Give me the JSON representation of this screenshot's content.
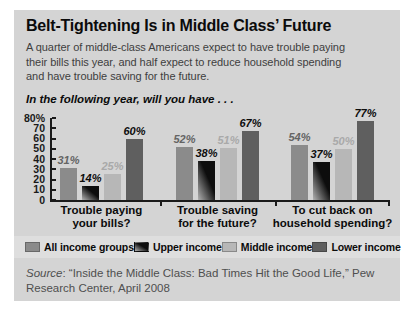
{
  "header": {
    "title": "Belt-Tightening Is in Middle Class’ Future",
    "subtitle": "A quarter of middle-class Americans expect to have trouble paying\ntheir bills this year, and half expect to reduce household spending\nand have trouble saving for the future.",
    "question": "In the following year, will you have . . ."
  },
  "chart_data": {
    "type": "bar",
    "categories": [
      "Trouble paying\nyour bills?",
      "Trouble saving\nfor the future?",
      "To cut back on\nhousehold spending?"
    ],
    "series": [
      {
        "name": "All income groups",
        "values": [
          31,
          52,
          54
        ],
        "color": "#8b8b8b",
        "label_color": "#646464"
      },
      {
        "name": "Upper income",
        "values": [
          14,
          38,
          37
        ],
        "color": "#0d0d0d",
        "color2": "#b2b2b2",
        "label_color": "#0d0d0d"
      },
      {
        "name": "Middle income",
        "values": [
          25,
          51,
          50
        ],
        "color": "#b7b7b7",
        "label_color": "#a9a9a9"
      },
      {
        "name": "Lower income",
        "values": [
          60,
          67,
          77
        ],
        "color": "#5f5f5f",
        "label_color": "#0d0d0d"
      }
    ],
    "ylim": [
      0,
      80
    ],
    "y_ticks": [
      "80%",
      "70",
      "60",
      "50",
      "40",
      "30",
      "20",
      "10",
      "0"
    ],
    "value_suffix": "%",
    "legend_position": "bottom",
    "grid": false,
    "axis_color": "#1a1a1a"
  },
  "footer": {
    "source_label": "Source",
    "source_text": ": “Inside the Middle Class: Bad Times Hit the Good Life,” Pew\nResearch Center, April 2008"
  }
}
